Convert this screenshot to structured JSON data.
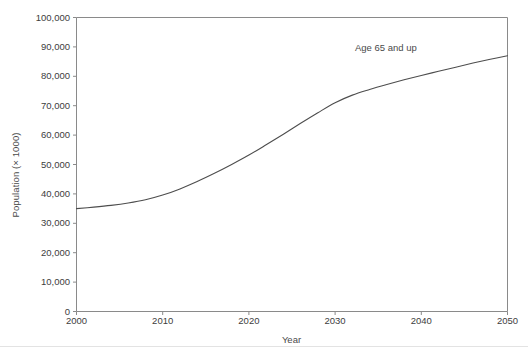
{
  "chart_data": {
    "type": "line",
    "title": "",
    "xlabel": "Year",
    "ylabel": "Population (× 1000)",
    "xlim": [
      2000,
      2050
    ],
    "ylim": [
      0,
      100000
    ],
    "grid": false,
    "legend": null,
    "xticks": [
      "2000",
      "2010",
      "2020",
      "2030",
      "2040",
      "2050"
    ],
    "xtick_values": [
      2000,
      2010,
      2020,
      2030,
      2040,
      2050
    ],
    "yticks": [
      "0",
      "10,000",
      "20,000",
      "30,000",
      "40,000",
      "50,000",
      "60,000",
      "70,000",
      "80,000",
      "90,000",
      "100,000"
    ],
    "ytick_values": [
      0,
      10000,
      20000,
      30000,
      40000,
      50000,
      60000,
      70000,
      80000,
      90000,
      100000
    ],
    "annotations": [
      {
        "text": "Age 65 and up",
        "x": 2035,
        "y": 92000
      }
    ],
    "series": [
      {
        "name": "Age 65 and up",
        "color": "#4d4d4d",
        "line_width": 1.1,
        "x": [
          2000,
          2002,
          2004,
          2006,
          2008,
          2010,
          2012,
          2014,
          2016,
          2018,
          2020,
          2022,
          2024,
          2026,
          2028,
          2030,
          2032,
          2034,
          2036,
          2038,
          2040,
          2042,
          2044,
          2046,
          2048,
          2050
        ],
        "values": [
          35000,
          35500,
          36100,
          36900,
          38000,
          39600,
          41700,
          44200,
          47000,
          50000,
          53200,
          56700,
          60300,
          64000,
          67600,
          71000,
          73600,
          75500,
          77200,
          78800,
          80300,
          81700,
          83100,
          84500,
          85800,
          87000
        ]
      }
    ]
  },
  "axes": {
    "ylabel_text": "Population (× 1000)",
    "xlabel_text": "Year"
  },
  "annotation": {
    "label": "Age 65 and up"
  }
}
